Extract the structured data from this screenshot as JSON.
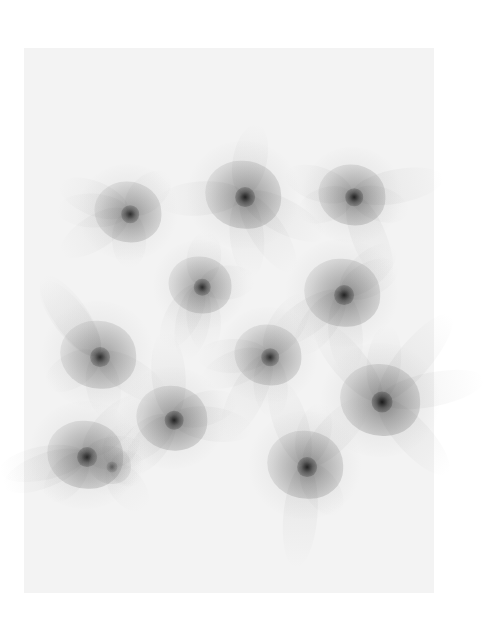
{
  "artwork": {
    "description": "Abstract generative composition of twelve translucent gray flower-like blobs with dark centers on a pale canvas",
    "background": "#ffffff",
    "canvas_color": "#f3f3f3",
    "flowers": [
      {
        "x": 128,
        "y": 212,
        "r": 32,
        "tone": 0.55
      },
      {
        "x": 243,
        "y": 195,
        "r": 36,
        "tone": 0.6
      },
      {
        "x": 352,
        "y": 195,
        "r": 32,
        "tone": 0.6
      },
      {
        "x": 200,
        "y": 285,
        "r": 30,
        "tone": 0.55
      },
      {
        "x": 342,
        "y": 293,
        "r": 36,
        "tone": 0.6
      },
      {
        "x": 98,
        "y": 355,
        "r": 36,
        "tone": 0.55
      },
      {
        "x": 268,
        "y": 355,
        "r": 32,
        "tone": 0.55
      },
      {
        "x": 380,
        "y": 400,
        "r": 38,
        "tone": 0.65
      },
      {
        "x": 172,
        "y": 418,
        "r": 34,
        "tone": 0.6
      },
      {
        "x": 85,
        "y": 455,
        "r": 36,
        "tone": 0.6
      },
      {
        "x": 305,
        "y": 465,
        "r": 36,
        "tone": 0.6
      },
      {
        "x": 110,
        "y": 465,
        "r": 20,
        "tone": 0.3
      }
    ]
  }
}
